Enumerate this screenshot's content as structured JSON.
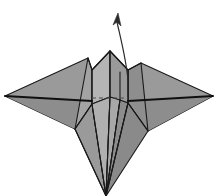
{
  "figure": {
    "background_color": "#ffffff",
    "canvas": {
      "width": 220,
      "height": 196
    }
  },
  "palette": {
    "paper_light": "#b4b4b4",
    "paper_mid": "#9a9a9a",
    "paper_dark": "#868686",
    "paper_darker": "#777777",
    "paper_pale": "#c2c2c2",
    "outline": "#1a1a1a",
    "ridge": "#101010",
    "hidden_crease": "#4a4a4a",
    "arrow": "#2b2b2b"
  },
  "geometry": {
    "left_wing": {
      "name": "left-wing",
      "fill": "#9a9a9a",
      "points": "88,58 5,96 75,129 92,104"
    },
    "left_wing_lower": {
      "name": "left-wing-underside",
      "fill": "#868686",
      "points": "5,96 75,129 92,104 98,97"
    },
    "right_wing": {
      "name": "right-wing",
      "fill": "#9a9a9a",
      "points": "141,63 213,96 148,131 128,103"
    },
    "right_wing_lower": {
      "name": "right-wing-underside",
      "fill": "#868686",
      "points": "213,96 148,131 128,103 120,97"
    },
    "center_peak_left": {
      "name": "center-peak-left-face",
      "fill": "#b4b4b4",
      "points": "110,51 92,70 92,104 110,97"
    },
    "center_peak_right": {
      "name": "center-peak-right-face",
      "fill": "#9a9a9a",
      "points": "110,51 128,70 128,103 110,97"
    },
    "left_inner_flap": {
      "name": "left-inner-flap",
      "fill": "#a3a3a3",
      "points": "88,58 92,70 92,104 75,129"
    },
    "right_inner_flap": {
      "name": "right-inner-flap",
      "fill": "#8e8e8e",
      "points": "141,63 128,70 128,103 148,131"
    },
    "tail_far_left": {
      "name": "tail-panel-far-left",
      "fill": "#9a9a9a",
      "points": "75,129 92,104 106,196"
    },
    "tail_left": {
      "name": "tail-panel-left",
      "fill": "#b0b0b0",
      "points": "92,104 110,97 106,196"
    },
    "tail_center": {
      "name": "tail-panel-center",
      "fill": "#a8a8a8",
      "points": "110,97 120,100 106,196"
    },
    "tail_right": {
      "name": "tail-panel-right",
      "fill": "#8c8c8c",
      "points": "120,100 128,103 106,196"
    },
    "tail_far_right": {
      "name": "tail-panel-far-right",
      "fill": "#8a8a8a",
      "points": "128,103 148,131 106,196"
    },
    "creases": [
      {
        "name": "crease-center-spine-upper",
        "d": "M110,51 L110,97"
      },
      {
        "name": "crease-left-peak-edge",
        "d": "M110,51 L92,70"
      },
      {
        "name": "crease-right-peak-edge",
        "d": "M110,51 L128,70"
      },
      {
        "name": "crease-left-fold-vertical",
        "d": "M92,70 L92,104"
      },
      {
        "name": "crease-right-fold-vertical",
        "d": "M128,70 L128,103"
      },
      {
        "name": "crease-left-wing-top",
        "d": "M88,58 L5,96"
      },
      {
        "name": "crease-left-wing-bottom",
        "d": "M5,96 L75,129"
      },
      {
        "name": "crease-right-wing-top",
        "d": "M141,63 L213,96"
      },
      {
        "name": "crease-right-wing-bottom",
        "d": "M213,96 L148,131"
      },
      {
        "name": "crease-left-wing-root",
        "d": "M88,58 L92,70"
      },
      {
        "name": "crease-right-wing-root",
        "d": "M141,63 L128,70"
      },
      {
        "name": "crease-left-wing-inner",
        "d": "M75,129 L92,104"
      },
      {
        "name": "crease-right-wing-inner",
        "d": "M148,131 L128,103"
      },
      {
        "name": "crease-tail-far-left",
        "d": "M75,129 L106,196"
      },
      {
        "name": "crease-tail-left",
        "d": "M92,104 L106,196"
      },
      {
        "name": "crease-tail-center",
        "d": "M110,97 L106,196"
      },
      {
        "name": "crease-tail-right",
        "d": "M120,100 L106,196"
      },
      {
        "name": "crease-tail-far-right",
        "d": "M128,103 L106,196"
      },
      {
        "name": "crease-inner-right-short",
        "d": "M120,72 L120,100"
      }
    ],
    "ridges": [
      {
        "name": "ridge-left-wing-spine",
        "d": "M5,96 L92,101"
      },
      {
        "name": "ridge-right-wing-spine",
        "d": "M213,96 L128,101"
      }
    ],
    "hidden_creases": [
      {
        "name": "hidden-crease-horizontal-center",
        "d": "M92,98 L128,98"
      }
    ],
    "arrow": {
      "name": "fold-direction-arrow",
      "shaft": "M128,80 C126,58 120,36 117,22",
      "head": "118,13 113,25 117,22 121,26"
    }
  },
  "labels": {
    "step_number": "",
    "caption": ""
  }
}
